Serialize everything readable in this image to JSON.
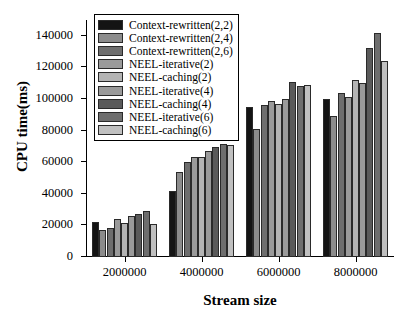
{
  "chart_data": {
    "type": "bar",
    "title": "",
    "xlabel": "Stream size",
    "ylabel": "CPU time(ms)",
    "categories": [
      "2000000",
      "4000000",
      "6000000",
      "8000000"
    ],
    "ylim": [
      0,
      150000
    ],
    "yticks": [
      0,
      20000,
      40000,
      60000,
      80000,
      100000,
      120000,
      140000
    ],
    "ytick_labels": [
      "0",
      "20000",
      "40000",
      "60000",
      "80000",
      "100000",
      "120000",
      "140000"
    ],
    "grid": false,
    "legend_position": "upper-left-inside",
    "series": [
      {
        "name": "Context-rewritten(2,2)",
        "color": "#141414",
        "values": [
          22000,
          42000,
          95000,
          100000
        ]
      },
      {
        "name": "Context-rewritten(2,4)",
        "color": "#8c8c8c",
        "values": [
          17000,
          54000,
          81000,
          89000
        ]
      },
      {
        "name": "Context-rewritten(2,6)",
        "color": "#6e6e6e",
        "values": [
          18500,
          60000,
          96000,
          104000
        ]
      },
      {
        "name": "NEEL-iterative(2)",
        "color": "#9a9a9a",
        "values": [
          24000,
          63500,
          98500,
          101000
        ]
      },
      {
        "name": "NEEL-caching(2)",
        "color": "#b4b4b4",
        "values": [
          21500,
          63000,
          97000,
          112000
        ]
      },
      {
        "name": "NEEL-iterative(4)",
        "color": "#9a9a9a",
        "values": [
          26000,
          67000,
          100000,
          110000
        ]
      },
      {
        "name": "NEEL-caching(4)",
        "color": "#5a5a5a",
        "values": [
          27500,
          69500,
          111000,
          132500
        ]
      },
      {
        "name": "NEEL-iterative(6)",
        "color": "#6e6e6e",
        "values": [
          29000,
          71500,
          108000,
          142000
        ]
      },
      {
        "name": "NEEL-caching(6)",
        "color": "#c0c0c0",
        "values": [
          21000,
          71000,
          109000,
          124000
        ]
      }
    ]
  }
}
